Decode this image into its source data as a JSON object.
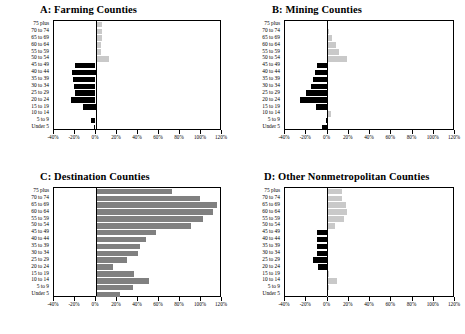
{
  "figure": {
    "categories": [
      "75 plus",
      "70 to 74",
      "65 to 69",
      "60 to 64",
      "55 to 59",
      "50 to 54",
      "45 to 49",
      "40 to 44",
      "35 to 39",
      "30 to 34",
      "25 to 29",
      "20 to 24",
      "15 to 19",
      "10 to 14",
      "5 to 9",
      "Under 5"
    ],
    "xticklabels": [
      "-40%",
      "-20%",
      "0%",
      "20%",
      "40%",
      "60%",
      "80%",
      "100%",
      "120%"
    ],
    "xtickvalues": [
      -40,
      -20,
      0,
      20,
      40,
      60,
      80,
      100,
      120
    ],
    "colors": {
      "negative": "#000000",
      "positive_light": "#c9c9c9",
      "positive_mid": "#808080",
      "axis": "#000000",
      "background": "#ffffff"
    }
  },
  "chart_data": [
    {
      "type": "bar",
      "panel": "A",
      "title": "A:  Farming Counties",
      "orientation": "horizontal",
      "xlabel": "",
      "ylabel": "",
      "xlim": [
        -40,
        120
      ],
      "grid": false,
      "categories": [
        "75 plus",
        "70 to 74",
        "65 to 69",
        "60 to 64",
        "55 to 59",
        "50 to 54",
        "45 to 49",
        "40 to 44",
        "35 to 39",
        "30 to 34",
        "25 to 29",
        "20 to 24",
        "15 to 19",
        "10 to 14",
        "5 to 9",
        "Under 5"
      ],
      "values": [
        6.5,
        6.0,
        6.0,
        5.5,
        5.0,
        13.0,
        -19.5,
        -22.5,
        -21.5,
        -21.0,
        -19.5,
        -24.0,
        -12.5,
        1.0,
        -4.0,
        -1.5
      ]
    },
    {
      "type": "bar",
      "panel": "B",
      "title": "B:  Mining Counties",
      "orientation": "horizontal",
      "xlabel": "",
      "ylabel": "",
      "xlim": [
        -40,
        120
      ],
      "grid": false,
      "categories": [
        "75 plus",
        "70 to 74",
        "65 to 69",
        "60 to 64",
        "55 to 59",
        "50 to 54",
        "45 to 49",
        "40 to 44",
        "35 to 39",
        "30 to 34",
        "25 to 29",
        "20 to 24",
        "15 to 19",
        "10 to 14",
        "5 to 9",
        "Under 5"
      ],
      "values": [
        0.5,
        1.5,
        5.0,
        8.5,
        11.5,
        19.5,
        -9.5,
        -11.0,
        -13.0,
        -15.5,
        -20.0,
        -26.0,
        -10.5,
        4.0,
        -0.5,
        -4.5
      ]
    },
    {
      "type": "bar",
      "panel": "C",
      "title": "C:  Destination Counties",
      "orientation": "horizontal",
      "xlabel": "",
      "ylabel": "",
      "xlim": [
        -40,
        120
      ],
      "grid": false,
      "categories": [
        "75 plus",
        "70 to 74",
        "65 to 69",
        "60 to 64",
        "55 to 59",
        "50 to 54",
        "45 to 49",
        "40 to 44",
        "35 to 39",
        "30 to 34",
        "25 to 29",
        "20 to 24",
        "15 to 19",
        "10 to 14",
        "5 to 9",
        "Under 5"
      ],
      "values": [
        74.0,
        101.0,
        117.0,
        113.0,
        104.0,
        92.0,
        58.0,
        49.0,
        43.0,
        41.0,
        30.0,
        17.0,
        37.0,
        52.0,
        36.0,
        24.0
      ]
    },
    {
      "type": "bar",
      "panel": "D",
      "title": "D:  Other Nonmetropolitan Counties",
      "orientation": "horizontal",
      "xlabel": "",
      "ylabel": "",
      "xlim": [
        -40,
        120
      ],
      "grid": false,
      "categories": [
        "75 plus",
        "70 to 74",
        "65 to 69",
        "60 to 64",
        "55 to 59",
        "50 to 54",
        "45 to 49",
        "40 to 44",
        "35 to 39",
        "30 to 34",
        "25 to 29",
        "20 to 24",
        "15 to 19",
        "10 to 14",
        "5 to 9",
        "Under 5"
      ],
      "values": [
        14.5,
        14.0,
        18.0,
        19.0,
        16.0,
        8.0,
        -9.5,
        -10.0,
        -10.0,
        -10.0,
        -13.0,
        -9.0,
        2.0,
        9.5,
        1.5,
        0.5
      ]
    }
  ]
}
